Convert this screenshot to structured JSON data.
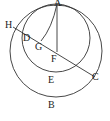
{
  "diagram": {
    "labels": {
      "A": "A",
      "H": "H",
      "D": "D",
      "G": "G",
      "F": "F",
      "E": "E",
      "C": "C",
      "B": "B"
    },
    "colors": {
      "stroke": "#333333",
      "text": "#222222",
      "background": "#ffffff"
    }
  }
}
